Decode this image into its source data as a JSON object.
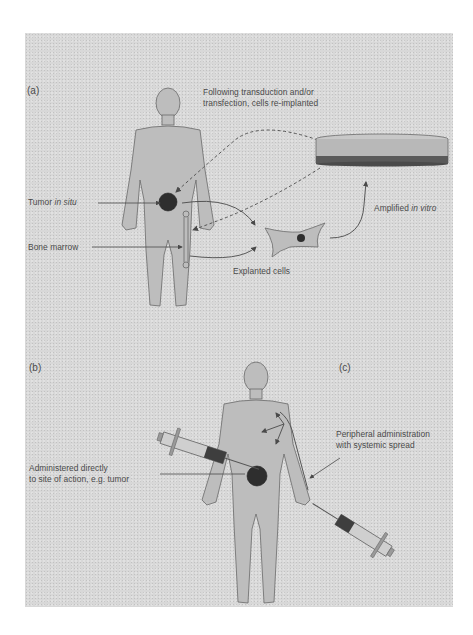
{
  "figure": {
    "panels": [
      {
        "id": "a",
        "label": "(a)"
      },
      {
        "id": "b",
        "label": "(b)"
      },
      {
        "id": "c",
        "label": "(c)"
      }
    ],
    "panel_a": {
      "reimplant_label_line1": "Following transduction and/or",
      "reimplant_label_line2": "transfection, cells re-implanted",
      "tumor_label_prefix": "Tumor ",
      "tumor_label_italic": "in situ",
      "bone_marrow_label": "Bone marrow",
      "explanted_label": "Explanted cells",
      "amplified_label_prefix": "Amplified ",
      "amplified_label_italic": "in vitro"
    },
    "panel_b": {
      "direct_label_line1": "Administered directly",
      "direct_label_line2": "to site of action, e.g. tumor"
    },
    "panel_c": {
      "peripheral_label_line1": "Peripheral administration",
      "peripheral_label_line2": "with systemic spread"
    },
    "colors": {
      "background": "#d8d8d8",
      "body_fill": "#bdbdbd",
      "outline": "#6a6a6a",
      "tumor": "#2e2e2e",
      "text": "#4a4a4a"
    }
  }
}
